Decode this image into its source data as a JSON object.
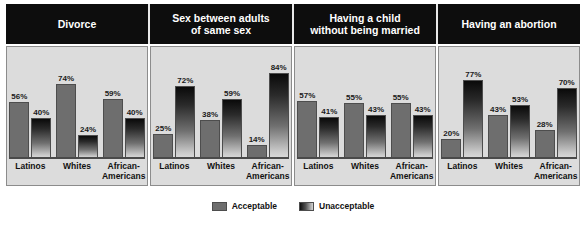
{
  "chart_data": {
    "type": "bar",
    "title": "",
    "xlabel": "",
    "ylabel": "",
    "ylim": [
      0,
      100
    ],
    "grid": false,
    "legend_position": "bottom",
    "categories": [
      "Latinos",
      "Whites",
      "African-Americans"
    ],
    "series": [
      {
        "name": "Acceptable",
        "color": "#6e6e6e"
      },
      {
        "name": "Unacceptable",
        "color": "#1a1a1a"
      }
    ],
    "panels": [
      {
        "title": "Divorce",
        "title_lines": [
          "Divorce"
        ],
        "values": {
          "Acceptable": [
            56,
            74,
            59
          ],
          "Unacceptable": [
            40,
            24,
            40
          ]
        },
        "labels": {
          "Acceptable": [
            "56%",
            "74%",
            "59%"
          ],
          "Unacceptable": [
            "40%",
            "24%",
            "40%"
          ]
        }
      },
      {
        "title": "Sex between adults of same sex",
        "title_lines": [
          "Sex between adults",
          "of same sex"
        ],
        "values": {
          "Acceptable": [
            25,
            38,
            14
          ],
          "Unacceptable": [
            72,
            59,
            84
          ]
        },
        "labels": {
          "Acceptable": [
            "25%",
            "38%",
            "14%"
          ],
          "Unacceptable": [
            "72%",
            "59%",
            "84%"
          ]
        }
      },
      {
        "title": "Having a child without being married",
        "title_lines": [
          "Having a child",
          "without being married"
        ],
        "values": {
          "Acceptable": [
            57,
            55,
            55
          ],
          "Unacceptable": [
            41,
            43,
            43
          ]
        },
        "labels": {
          "Acceptable": [
            "57%",
            "55%",
            "55%"
          ],
          "Unacceptable": [
            "41%",
            "43%",
            "43%"
          ]
        }
      },
      {
        "title": "Having an abortion",
        "title_lines": [
          "Having an abortion"
        ],
        "values": {
          "Acceptable": [
            20,
            43,
            28
          ],
          "Unacceptable": [
            77,
            53,
            70
          ]
        },
        "labels": {
          "Acceptable": [
            "20%",
            "43%",
            "28%"
          ],
          "Unacceptable": [
            "77%",
            "53%",
            "70%"
          ]
        }
      }
    ]
  },
  "headers": [
    {
      "line1": "Divorce",
      "line2": ""
    },
    {
      "line1": "Sex between adults",
      "line2": "of same sex"
    },
    {
      "line1": "Having a child",
      "line2": "without being married"
    },
    {
      "line1": "Having an abortion",
      "line2": ""
    }
  ],
  "categories": [
    {
      "line1": "Latinos",
      "line2": ""
    },
    {
      "line1": "Whites",
      "line2": ""
    },
    {
      "line1": "African-",
      "line2": "Americans"
    }
  ],
  "legend": {
    "acceptable": "Acceptable",
    "unacceptable": "Unacceptable"
  },
  "colors": {
    "header_bg": "#0d0d0d",
    "panel_bg": "#dcdcdc",
    "acceptable": "#6e6e6e",
    "unacceptable_top": "#0a0a0a",
    "unacceptable_bottom": "#dadada",
    "page_bg": "#ffffff"
  }
}
